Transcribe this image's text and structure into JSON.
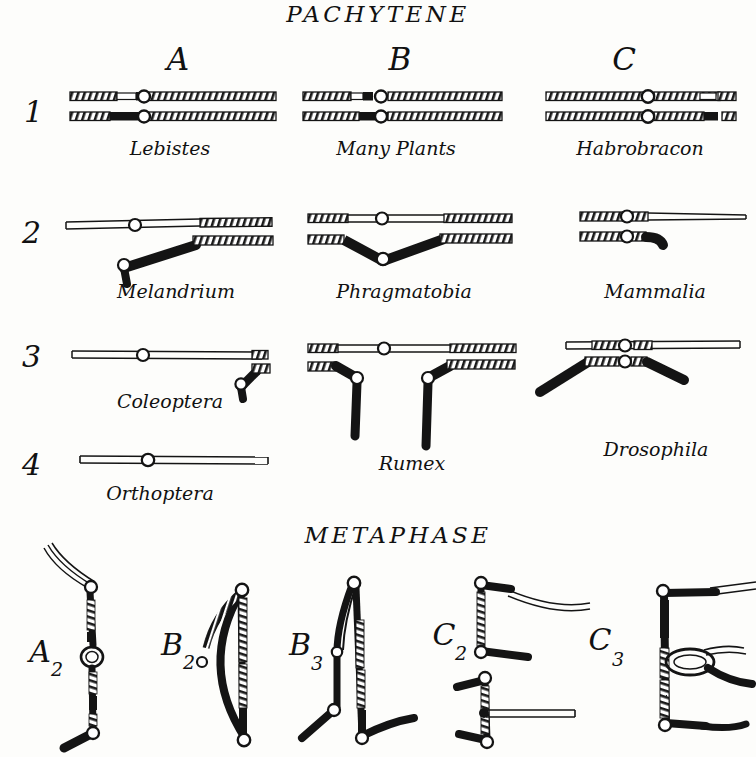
{
  "figure": {
    "sections": [
      {
        "id": "pachytene",
        "heading": "PACHYTENE"
      },
      {
        "id": "metaphase",
        "heading": "METAPHASE"
      }
    ],
    "column_labels": [
      "A",
      "B",
      "C"
    ],
    "row_labels": [
      "1",
      "2",
      "3",
      "4"
    ],
    "ink_color": "#111111",
    "paper_color": "#fdfdfb"
  },
  "pachytene": {
    "cells": [
      {
        "row": "1",
        "column": "A",
        "species": "Lebistes"
      },
      {
        "row": "1",
        "column": "B",
        "species": "Many Plants"
      },
      {
        "row": "1",
        "column": "C",
        "species": "Habrobracon"
      },
      {
        "row": "2",
        "column": "A",
        "species": "Melandrium"
      },
      {
        "row": "2",
        "column": "B",
        "species": "Phragmatobia"
      },
      {
        "row": "2",
        "column": "C",
        "species": "Mammalia"
      },
      {
        "row": "3",
        "column": "A",
        "species": "Coleoptera"
      },
      {
        "row": "3",
        "column": "B",
        "species": "Rumex"
      },
      {
        "row": "3",
        "column": "C",
        "species": "Drosophila"
      },
      {
        "row": "4",
        "column": "A",
        "species": "Orthoptera"
      }
    ]
  },
  "metaphase": {
    "figures": [
      {
        "base": "A",
        "sub": "2",
        "label": "A2"
      },
      {
        "base": "B",
        "sub": "2",
        "label": "B2"
      },
      {
        "base": "B",
        "sub": "3",
        "label": "B3"
      },
      {
        "base": "C",
        "sub": "2",
        "label": "C2"
      },
      {
        "base": "C",
        "sub": "3",
        "label": "C3"
      }
    ]
  }
}
